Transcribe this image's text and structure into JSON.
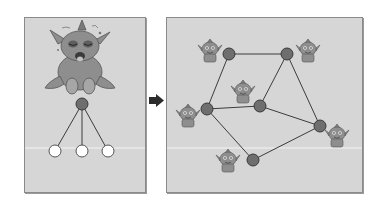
{
  "figure": {
    "colors": {
      "panel_bg": "#d6d6d6",
      "panel_border": "#8a8a8a",
      "node_fill": "#6e6e6e",
      "node_stroke": "#3a3a3a",
      "leaf_fill": "#ffffff",
      "edge": "#3c3c3c",
      "divider": "#f4f4f4",
      "arrow": "#2b2b2b",
      "monster": "#8e8e8e"
    },
    "left_panel": {
      "label": "sad-monster-tree",
      "root": {
        "x": 82,
        "y": 104
      },
      "leaves": [
        {
          "x": 55,
          "y": 151
        },
        {
          "x": 82,
          "y": 151
        },
        {
          "x": 108,
          "y": 151
        }
      ]
    },
    "arrow": {
      "direction": "right"
    },
    "right_panel": {
      "label": "happy-monster-network",
      "nodes": [
        {
          "id": "A",
          "x": 229,
          "y": 54
        },
        {
          "id": "B",
          "x": 287,
          "y": 54
        },
        {
          "id": "C",
          "x": 207,
          "y": 109
        },
        {
          "id": "D",
          "x": 260,
          "y": 106
        },
        {
          "id": "E",
          "x": 320,
          "y": 126
        },
        {
          "id": "F",
          "x": 253,
          "y": 160
        }
      ],
      "edges": [
        [
          "A",
          "B"
        ],
        [
          "A",
          "C"
        ],
        [
          "B",
          "D"
        ],
        [
          "B",
          "E"
        ],
        [
          "C",
          "D"
        ],
        [
          "D",
          "E"
        ],
        [
          "C",
          "F"
        ],
        [
          "F",
          "E"
        ]
      ],
      "monsters": [
        {
          "x": 210,
          "y": 52
        },
        {
          "x": 308,
          "y": 52
        },
        {
          "x": 243,
          "y": 93
        },
        {
          "x": 188,
          "y": 117
        },
        {
          "x": 337,
          "y": 137
        },
        {
          "x": 228,
          "y": 162
        }
      ]
    }
  }
}
